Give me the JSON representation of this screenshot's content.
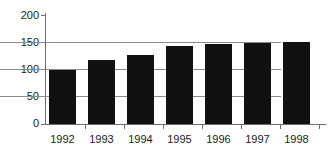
{
  "chart_data": {
    "type": "bar",
    "title": "",
    "xlabel": "",
    "ylabel": "",
    "categories": [
      "1992",
      "1993",
      "1994",
      "1995",
      "1996",
      "1997",
      "1998"
    ],
    "values": [
      100,
      118,
      127,
      143,
      146,
      148,
      150
    ],
    "ylim": [
      0,
      200
    ],
    "ytick_labels": [
      "0",
      "50",
      "100",
      "150",
      "200"
    ],
    "ytick_values": [
      0,
      50,
      100,
      150,
      200
    ],
    "gridlines_at": [
      50,
      100,
      150
    ],
    "grid": true,
    "legend": "none",
    "bar_color": "#111111",
    "grid_color": "#8b8b8b",
    "axis_color": "#6e6e6e",
    "text_color": "#1a1a1a",
    "background": "#ffffff"
  }
}
